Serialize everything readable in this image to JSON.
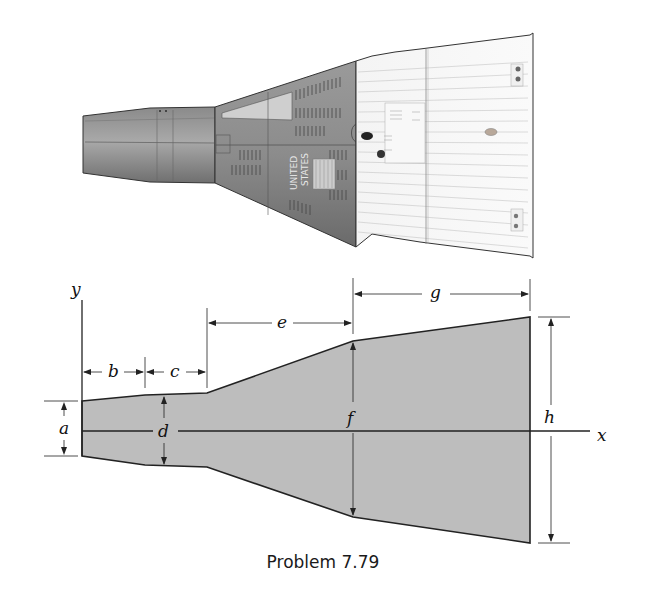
{
  "figure": {
    "caption": "Problem 7.79",
    "illustration": {
      "subject": "space capsule side view",
      "marking": [
        "UNITED",
        "STATES"
      ]
    },
    "diagram": {
      "axes": {
        "x_label": "x",
        "y_label": "y"
      },
      "dimension_labels": {
        "a": "a",
        "b": "b",
        "c": "c",
        "d": "d",
        "e": "e",
        "f": "f",
        "g": "g",
        "h": "h"
      },
      "fill_color": "#bdbdbd",
      "outline_color": "#222222"
    }
  }
}
